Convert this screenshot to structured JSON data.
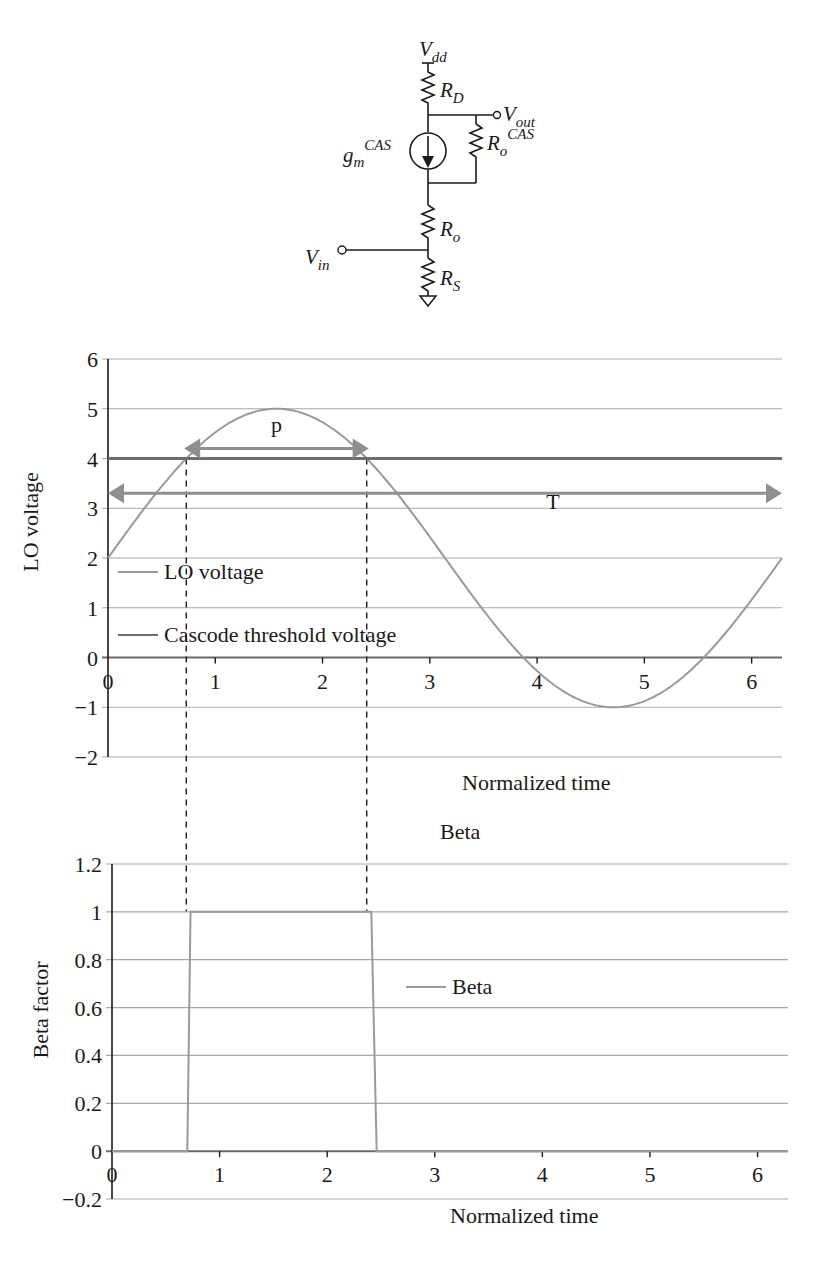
{
  "circuit": {
    "labels": {
      "vdd": {
        "main": "V",
        "sub": "dd"
      },
      "rd": {
        "main": "R",
        "sub": "D"
      },
      "vout": {
        "main": "V",
        "sub": "out"
      },
      "gm": {
        "main": "g",
        "sub": "m",
        "sup": "CAS"
      },
      "ro_cas": {
        "main": "R",
        "sub": "o",
        "sup": "CAS"
      },
      "ro": {
        "main": "R",
        "sub": "o"
      },
      "vin": {
        "main": "V",
        "sub": "in"
      },
      "rs": {
        "main": "R",
        "sub": "S"
      }
    }
  },
  "chart_data": [
    {
      "type": "line",
      "title": "",
      "xlabel": "Normalized time",
      "ylabel": "LO voltage",
      "xlim": [
        0,
        6.283
      ],
      "ylim": [
        -2,
        6
      ],
      "xticks": [
        "0",
        "1",
        "2",
        "3",
        "4",
        "5",
        "6"
      ],
      "yticks": [
        "6",
        "5",
        "4",
        "3",
        "2",
        "1",
        "0",
        "-1",
        "-2"
      ],
      "grid": true,
      "legend_position": "inside-left",
      "series": [
        {
          "name": "LO voltage",
          "formula": "2 + 3*sin(t)",
          "color": "#9a9a9a",
          "x": [
            0,
            0.5236,
            0.7297,
            1.0472,
            1.5708,
            2.0944,
            2.4119,
            2.618,
            3.1416,
            3.6652,
            3.8713,
            4.1888,
            4.7124,
            5.236,
            5.5535,
            5.7596,
            6.2832
          ],
          "values": [
            2,
            3.5,
            4,
            4.6,
            5,
            4.6,
            4,
            3.5,
            2,
            0.5,
            0,
            -0.6,
            -1,
            -0.6,
            0,
            0.5,
            2
          ]
        },
        {
          "name": "Cascode threshold voltage",
          "color": "#6e6e6e",
          "x": [
            0,
            6.2832
          ],
          "values": [
            4,
            4
          ]
        }
      ],
      "annotations": [
        {
          "label": "p",
          "type": "double-arrow",
          "from_x": 0.71,
          "to_x": 2.43,
          "y": 4.2
        },
        {
          "label": "T",
          "type": "double-arrow",
          "from_x": 0,
          "to_x": 6.283,
          "y": 3.3
        },
        {
          "type": "dashed-vline",
          "x": 0.7297
        },
        {
          "type": "dashed-vline",
          "x": 2.4119
        }
      ]
    },
    {
      "type": "line",
      "title": "Beta",
      "xlabel": "Normalized time",
      "ylabel": "Beta factor",
      "xlim": [
        0,
        6.283
      ],
      "ylim": [
        -0.2,
        1.2
      ],
      "xticks": [
        "0",
        "1",
        "2",
        "3",
        "4",
        "5",
        "6"
      ],
      "yticks": [
        "1.2",
        "1",
        "0.8",
        "0.6",
        "0.4",
        "0.2",
        "0",
        "-0.2"
      ],
      "grid": true,
      "legend_position": "center",
      "series": [
        {
          "name": "Beta",
          "color": "#9a9a9a",
          "x": [
            0,
            0.7,
            0.73,
            2.41,
            2.46,
            6.283
          ],
          "values": [
            0,
            0,
            1,
            1,
            0,
            0
          ]
        }
      ]
    }
  ]
}
